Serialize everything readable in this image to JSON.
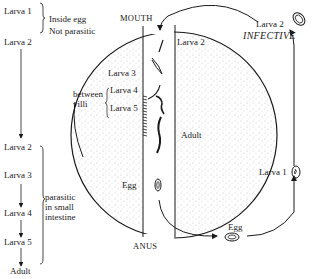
{
  "left_column": {
    "stage_list_top": [
      "Larva 1",
      "Larva 2"
    ],
    "top_bracket_text": [
      "Inside egg",
      "Not parasitic"
    ],
    "stage_list_bottom": [
      "Larva 2",
      "Larva 3",
      "Larva 4",
      "Larva 5",
      "Adult"
    ],
    "bottom_bracket_text": [
      "parasitic",
      "in small",
      "intestine"
    ]
  },
  "intestine": {
    "mouth_label": "MOUTH",
    "anus_label": "ANUS",
    "inner_labels": {
      "larva2": "Larva 2",
      "larva3": "Larva 3",
      "larva4": "Larva 4",
      "larva5": "Larva 5",
      "between_villi": [
        "between",
        "villi"
      ],
      "adult": "Adult",
      "egg": "Egg"
    }
  },
  "external_cycle": {
    "egg_label": "Egg",
    "larva1_label": "Larva 1",
    "larva2_label": "Larva 2",
    "infective_label": "INFECTIVE"
  },
  "colors": {
    "ink": "#1a1a1a",
    "stipple": "#8a8a8a",
    "background": "#ffffff"
  }
}
